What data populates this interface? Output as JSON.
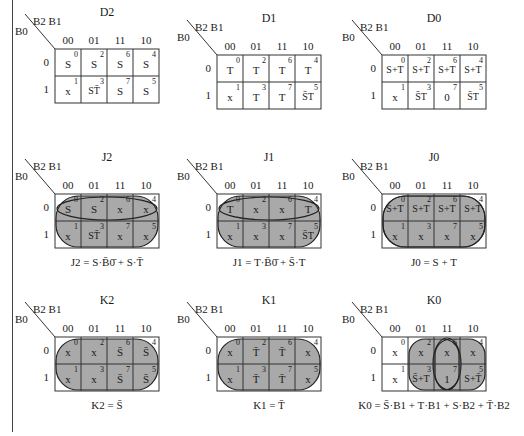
{
  "axis_labels": {
    "columns": "B2 B1",
    "rows": "B0"
  },
  "column_codes": [
    "00",
    "01",
    "11",
    "10"
  ],
  "row_codes": [
    "0",
    "1"
  ],
  "colors": {
    "shade": "#a9a9a9",
    "grid": "#333333",
    "text": "#1a1a1a"
  },
  "maps": [
    {
      "id": "D2",
      "title": "D2",
      "cells": [
        [
          {
            "v": "S",
            "idx": "0"
          },
          {
            "v": "S",
            "idx": "2"
          },
          {
            "v": "S",
            "idx": "6"
          },
          {
            "v": "S",
            "idx": "4"
          }
        ],
        [
          {
            "v": "x",
            "idx": "1"
          },
          {
            "v": "ST̄",
            "idx": "3"
          },
          {
            "v": "S",
            "idx": "7"
          },
          {
            "v": "S",
            "idx": "5"
          }
        ]
      ],
      "equation": ""
    },
    {
      "id": "D1",
      "title": "D1",
      "cells": [
        [
          {
            "v": "T",
            "idx": "0"
          },
          {
            "v": "T",
            "idx": "2"
          },
          {
            "v": "T",
            "idx": "6"
          },
          {
            "v": "T",
            "idx": "4"
          }
        ],
        [
          {
            "v": "x",
            "idx": "1"
          },
          {
            "v": "T",
            "idx": "3"
          },
          {
            "v": "T",
            "idx": "7"
          },
          {
            "v": "S̄T",
            "idx": "5"
          }
        ]
      ],
      "equation": ""
    },
    {
      "id": "D0",
      "title": "D0",
      "cells": [
        [
          {
            "v": "S+T",
            "idx": "0"
          },
          {
            "v": "S+T",
            "idx": "2"
          },
          {
            "v": "S+T",
            "idx": "6"
          },
          {
            "v": "S+T",
            "idx": "4"
          }
        ],
        [
          {
            "v": "x",
            "idx": "1"
          },
          {
            "v": "S̄T",
            "idx": "3"
          },
          {
            "v": "0",
            "idx": "7"
          },
          {
            "v": "S̄T",
            "idx": "5"
          }
        ]
      ],
      "equation": ""
    },
    {
      "id": "J2",
      "title": "J2",
      "cells": [
        [
          {
            "v": "S",
            "idx": "0"
          },
          {
            "v": "S",
            "idx": "2"
          },
          {
            "v": "x",
            "idx": "6"
          },
          {
            "v": "x",
            "idx": "4"
          }
        ],
        [
          {
            "v": "x",
            "idx": "1"
          },
          {
            "v": "ST̄",
            "idx": "3"
          },
          {
            "v": "x",
            "idx": "7"
          },
          {
            "v": "x",
            "idx": "5"
          }
        ]
      ],
      "equation": "J2 = S·B̄0̄ + S·T̄"
    },
    {
      "id": "J1",
      "title": "J1",
      "cells": [
        [
          {
            "v": "T",
            "idx": "0"
          },
          {
            "v": "x",
            "idx": "2"
          },
          {
            "v": "x",
            "idx": "6"
          },
          {
            "v": "T",
            "idx": "4"
          }
        ],
        [
          {
            "v": "x",
            "idx": "1"
          },
          {
            "v": "x",
            "idx": "3"
          },
          {
            "v": "x",
            "idx": "7"
          },
          {
            "v": "S̄T",
            "idx": "5"
          }
        ]
      ],
      "equation": "J1 = T·B̄0̄ + S̄·T"
    },
    {
      "id": "J0",
      "title": "J0",
      "cells": [
        [
          {
            "v": "S+T",
            "idx": "0"
          },
          {
            "v": "S+T",
            "idx": "2"
          },
          {
            "v": "S+T",
            "idx": "6"
          },
          {
            "v": "S+T",
            "idx": "4"
          }
        ],
        [
          {
            "v": "x",
            "idx": "1"
          },
          {
            "v": "x",
            "idx": "3"
          },
          {
            "v": "x",
            "idx": "7"
          },
          {
            "v": "x",
            "idx": "5"
          }
        ]
      ],
      "equation": "J0 = S + T"
    },
    {
      "id": "K2",
      "title": "K2",
      "cells": [
        [
          {
            "v": "x",
            "idx": "0"
          },
          {
            "v": "x",
            "idx": "2"
          },
          {
            "v": "S̄",
            "idx": "6"
          },
          {
            "v": "S̄",
            "idx": "4"
          }
        ],
        [
          {
            "v": "x",
            "idx": "1"
          },
          {
            "v": "x",
            "idx": "3"
          },
          {
            "v": "S̄",
            "idx": "7"
          },
          {
            "v": "S̄",
            "idx": "5"
          }
        ]
      ],
      "equation": "K2 = S̄"
    },
    {
      "id": "K1",
      "title": "K1",
      "cells": [
        [
          {
            "v": "x",
            "idx": "0"
          },
          {
            "v": "T̄",
            "idx": "2"
          },
          {
            "v": "T̄",
            "idx": "6"
          },
          {
            "v": "x",
            "idx": "4"
          }
        ],
        [
          {
            "v": "x",
            "idx": "1"
          },
          {
            "v": "T̄",
            "idx": "3"
          },
          {
            "v": "T̄",
            "idx": "7"
          },
          {
            "v": "x",
            "idx": "5"
          }
        ]
      ],
      "equation": "K1 = T̄"
    },
    {
      "id": "K0",
      "title": "K0",
      "cells": [
        [
          {
            "v": "x",
            "idx": "0"
          },
          {
            "v": "x",
            "idx": "2"
          },
          {
            "v": "x",
            "idx": "6"
          },
          {
            "v": "x",
            "idx": "4"
          }
        ],
        [
          {
            "v": "x",
            "idx": "1"
          },
          {
            "v": "S̄+T",
            "idx": "3"
          },
          {
            "v": "1",
            "idx": "7"
          },
          {
            "v": "S+T̄",
            "idx": "5"
          }
        ]
      ],
      "equation": "K0 = S̄·B1 + T·B1 + S·B2 + T̄·B2"
    }
  ]
}
